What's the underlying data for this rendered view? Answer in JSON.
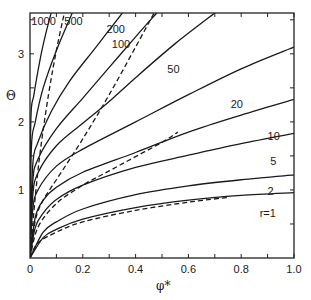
{
  "chart_data": {
    "type": "line",
    "title": "",
    "xlabel": "φ*",
    "ylabel": "Θ",
    "xlim": [
      0,
      1.0
    ],
    "ylim": [
      0,
      3.6
    ],
    "grid": false,
    "x_ticks": [
      "0",
      "0.2",
      "0.4",
      "0.6",
      "0.8",
      "1.0"
    ],
    "y_ticks": [
      "1",
      "2",
      "3"
    ],
    "series": [
      {
        "name": "r=1",
        "style": "solid",
        "x": [
          0,
          0.05,
          0.1,
          0.2,
          0.4,
          0.6,
          0.8,
          1.0
        ],
        "y": [
          0,
          0.3,
          0.42,
          0.57,
          0.74,
          0.85,
          0.92,
          0.96
        ]
      },
      {
        "name": "2",
        "style": "solid",
        "x": [
          0,
          0.05,
          0.1,
          0.2,
          0.4,
          0.6,
          0.8,
          1.0
        ],
        "y": [
          0,
          0.38,
          0.53,
          0.72,
          0.93,
          1.06,
          1.15,
          1.22
        ]
      },
      {
        "name": "5",
        "style": "solid",
        "x": [
          0,
          0.02,
          0.05,
          0.1,
          0.2,
          0.4,
          0.6,
          0.8,
          1.0
        ],
        "y": [
          0,
          0.45,
          0.66,
          0.86,
          1.07,
          1.33,
          1.51,
          1.68,
          1.83
        ]
      },
      {
        "name": "10",
        "style": "solid",
        "x": [
          0,
          0.02,
          0.05,
          0.1,
          0.2,
          0.4,
          0.6,
          0.8,
          1.0
        ],
        "y": [
          0,
          0.6,
          0.85,
          1.04,
          1.26,
          1.55,
          1.85,
          2.1,
          2.33
        ]
      },
      {
        "name": "20",
        "style": "solid",
        "x": [
          0,
          0.01,
          0.03,
          0.1,
          0.2,
          0.4,
          0.6,
          0.8,
          1.0
        ],
        "y": [
          0,
          0.7,
          1.0,
          1.35,
          1.6,
          2.0,
          2.4,
          2.78,
          3.1
        ]
      },
      {
        "name": "50",
        "style": "solid",
        "x": [
          0,
          0.01,
          0.03,
          0.1,
          0.2,
          0.3,
          0.4,
          0.55,
          0.7
        ],
        "y": [
          0,
          0.9,
          1.25,
          1.65,
          1.98,
          2.3,
          2.65,
          3.15,
          3.6
        ]
      },
      {
        "name": "100",
        "style": "solid",
        "x": [
          0,
          0.01,
          0.03,
          0.1,
          0.2,
          0.3,
          0.4,
          0.48
        ],
        "y": [
          0,
          1.1,
          1.45,
          1.9,
          2.35,
          2.8,
          3.25,
          3.6
        ]
      },
      {
        "name": "200",
        "style": "solid",
        "x": [
          0,
          0.01,
          0.03,
          0.08,
          0.15,
          0.25,
          0.35
        ],
        "y": [
          0,
          1.35,
          1.7,
          2.15,
          2.6,
          3.1,
          3.6
        ]
      },
      {
        "name": "500",
        "style": "solid",
        "x": [
          0,
          0.005,
          0.02,
          0.05,
          0.1,
          0.16
        ],
        "y": [
          0,
          1.6,
          2.0,
          2.5,
          3.05,
          3.6
        ]
      },
      {
        "name": "1000",
        "style": "solid",
        "x": [
          0,
          0.003,
          0.015,
          0.04,
          0.06,
          0.08
        ],
        "y": [
          0,
          2.0,
          2.4,
          2.95,
          3.3,
          3.6
        ]
      },
      {
        "name": "dashed-a",
        "style": "dashed",
        "x": [
          0,
          0.02,
          0.04,
          0.07,
          0.1,
          0.13
        ],
        "y": [
          0,
          0.9,
          1.6,
          2.4,
          3.05,
          3.6
        ]
      },
      {
        "name": "dashed-b",
        "style": "dashed",
        "x": [
          0,
          0.02,
          0.05,
          0.1,
          0.2,
          0.3,
          0.4,
          0.47
        ],
        "y": [
          0,
          0.55,
          0.85,
          1.15,
          1.75,
          2.4,
          3.1,
          3.6
        ]
      },
      {
        "name": "dashed-c",
        "style": "dashed",
        "x": [
          0,
          0.03,
          0.1,
          0.2,
          0.3,
          0.4,
          0.5,
          0.56
        ],
        "y": [
          0,
          0.45,
          0.8,
          1.07,
          1.28,
          1.49,
          1.7,
          1.85
        ]
      },
      {
        "name": "dashed-d",
        "style": "dashed",
        "x": [
          0,
          0.03,
          0.1,
          0.2,
          0.4,
          0.6,
          0.75
        ],
        "y": [
          0,
          0.22,
          0.38,
          0.53,
          0.7,
          0.82,
          0.89
        ]
      }
    ],
    "curve_labels": [
      {
        "text": "1000",
        "x": 0.005,
        "y": 3.42
      },
      {
        "text": "500",
        "x": 0.13,
        "y": 3.42
      },
      {
        "text": "200",
        "x": 0.29,
        "y": 3.3
      },
      {
        "text": "100",
        "x": 0.31,
        "y": 3.08
      },
      {
        "text": "50",
        "x": 0.52,
        "y": 2.72
      },
      {
        "text": "20",
        "x": 0.76,
        "y": 2.2
      },
      {
        "text": "10",
        "x": 0.9,
        "y": 1.73
      },
      {
        "text": "5",
        "x": 0.91,
        "y": 1.37
      },
      {
        "text": "2",
        "x": 0.9,
        "y": 0.92
      },
      {
        "text": "r=1",
        "x": 0.87,
        "y": 0.6
      }
    ]
  }
}
